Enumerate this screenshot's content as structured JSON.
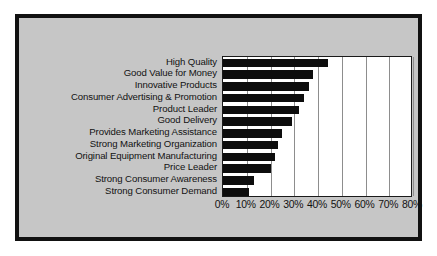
{
  "chart_data": {
    "type": "bar",
    "orientation": "horizontal",
    "title": "",
    "subtitle": "",
    "xlabel": "",
    "ylabel": "",
    "xlim": [
      0,
      80
    ],
    "xtick_labels": [
      "0%",
      "10%",
      "20%",
      "30%",
      "40%",
      "50%",
      "60%",
      "70%",
      "80%"
    ],
    "xtick_values": [
      0,
      10,
      20,
      30,
      40,
      50,
      60,
      70,
      80
    ],
    "grid": "vertical",
    "legend": "none",
    "categories": [
      "High Quality",
      "Good Value for Money",
      "Innovative Products",
      "Consumer Advertising & Promotion",
      "Product Leader",
      "Good Delivery",
      "Provides Marketing Assistance",
      "Strong Marketing Organization",
      "Original Equipment Manufacturing",
      "Price Leader",
      "Strong Consumer Awareness",
      "Strong Consumer Demand"
    ],
    "values": [
      44,
      38,
      36,
      34,
      32,
      29,
      25,
      23,
      22,
      20,
      13,
      11
    ]
  },
  "style": {
    "bar_color": "#0d0d0d",
    "plot_background": "#ffffff",
    "canvas_background": "#c6c6c6",
    "frame_color": "#111111",
    "gridline_color": "#8d8d8d",
    "text_color": "#121212"
  }
}
